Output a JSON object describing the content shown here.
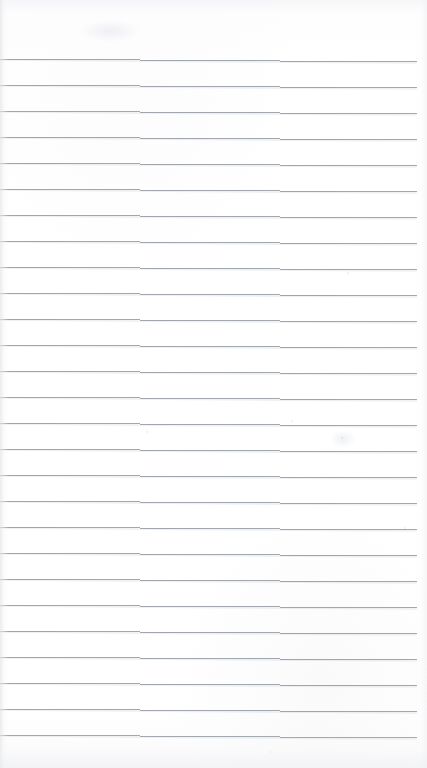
{
  "document": {
    "kind": "scanned-lined-paper",
    "title": "",
    "page_width": 427,
    "page_height": 768,
    "background_color": "#ffffff",
    "text_content": "",
    "handwriting_present": false,
    "printed_text_present": false
  },
  "ruling": {
    "line_color": "#9aa0a6",
    "line_thickness_px": 1,
    "line_spacing_px": 26,
    "first_line_y": 59,
    "line_count": 27,
    "left_edge_x": 0,
    "right_edge_x": 417,
    "right_margin_px": 10,
    "tilt_drop_px": 3,
    "top_margin_px": 59,
    "bottom_margin_px": 35,
    "margin_rule_present": false,
    "line_y_positions": [
      59,
      85,
      111,
      137,
      163,
      189,
      215,
      241,
      267,
      293,
      319,
      345,
      371,
      397,
      423,
      449,
      475,
      501,
      527,
      553,
      579,
      605,
      631,
      657,
      683,
      709,
      735
    ]
  },
  "artifacts": {
    "edge_vignette": true,
    "vignette_color": "#e4e5e8",
    "scan_specks": [
      {
        "x": 347,
        "y": 272,
        "size": 2
      },
      {
        "x": 341,
        "y": 437,
        "size": 2
      },
      {
        "x": 291,
        "y": 420,
        "size": 2
      },
      {
        "x": 146,
        "y": 431,
        "size": 2
      },
      {
        "x": 269,
        "y": 751,
        "size": 2
      },
      {
        "x": 404,
        "y": 527,
        "size": 2
      }
    ],
    "smudges": [
      {
        "x": 330,
        "y": 430,
        "w": 26,
        "h": 18
      },
      {
        "x": 80,
        "y": 20,
        "w": 60,
        "h": 22
      }
    ]
  },
  "accessibility": {
    "description": "Blank scanned page of lined notebook paper with evenly spaced horizontal ruled lines and no writing."
  }
}
